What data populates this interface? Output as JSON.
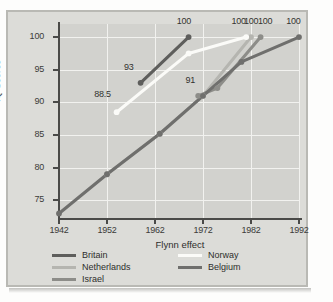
{
  "figure": {
    "caption": "",
    "colors": {
      "card_bg": "#dcdcd8",
      "plot_bg": "#d2d2ce",
      "grid": "#f2f2ef",
      "axis": "#4a4a48",
      "britain": "#5e5e5c",
      "netherlands": "#b5b5b0",
      "israel": "#8d8d89",
      "norway": "#fbfbf8",
      "belgium": "#6f6f6d"
    }
  },
  "chart_data": {
    "type": "line",
    "title": "",
    "xlabel": "Flynn effect",
    "ylabel": "IQ Scores",
    "xlim": [
      1942,
      1992
    ],
    "ylim": [
      72,
      102
    ],
    "xticks": [
      1942,
      1952,
      1962,
      1972,
      1982,
      1992
    ],
    "yticks": [
      75,
      80,
      85,
      90,
      95,
      100
    ],
    "grid": true,
    "legend_position": "below-plot",
    "series": [
      {
        "name": "Britain",
        "color": "#5e5e5c",
        "x": [
          1959,
          1969
        ],
        "y": [
          93,
          100
        ],
        "labels": [
          "93",
          "100"
        ]
      },
      {
        "name": "Netherlands",
        "color": "#b5b5b0",
        "x": [
          1952,
          1963,
          1972,
          1982
        ],
        "y": [
          79,
          85.2,
          91,
          100
        ],
        "labels": [
          "79",
          "",
          "",
          "100"
        ]
      },
      {
        "name": "Israel",
        "color": "#8d8d89",
        "x": [
          1971,
          1975,
          1984
        ],
        "y": [
          91,
          92.2,
          100
        ],
        "labels": [
          "91",
          "",
          "100"
        ]
      },
      {
        "name": "Norway",
        "color": "#fbfbf8",
        "x": [
          1954,
          1969,
          1981
        ],
        "y": [
          88.5,
          97.5,
          100
        ],
        "labels": [
          "88.5",
          "",
          "100"
        ]
      },
      {
        "name": "Belgium",
        "color": "#6f6f6d",
        "x": [
          1942,
          1952,
          1963,
          1972,
          1980,
          1992
        ],
        "y": [
          73,
          79,
          85.2,
          91,
          96.2,
          100
        ],
        "labels": [
          "",
          "",
          "",
          "",
          "",
          "100"
        ]
      }
    ],
    "point_annotations": [
      {
        "text": "100",
        "x": 1968.2,
        "y": 102.3
      },
      {
        "text": "93",
        "x": 1957.2,
        "y": 95.2
      },
      {
        "text": "88.5",
        "x": 1951.0,
        "y": 91.2
      },
      {
        "text": "91",
        "x": 1970.0,
        "y": 93.3
      },
      {
        "text": "100",
        "x": 1979.6,
        "y": 102.3
      },
      {
        "text": "100",
        "x": 1982.2,
        "y": 102.3
      },
      {
        "text": "100",
        "x": 1985.1,
        "y": 102.3
      },
      {
        "text": "100",
        "x": 1991.0,
        "y": 102.3
      }
    ]
  },
  "legend": {
    "left_column": [
      {
        "label": "Britain",
        "color": "#5e5e5c"
      },
      {
        "label": "Netherlands",
        "color": "#b5b5b0"
      },
      {
        "label": "Israel",
        "color": "#8d8d89"
      }
    ],
    "right_column": [
      {
        "label": "Norway",
        "color": "#fbfbf8"
      },
      {
        "label": "Belgium",
        "color": "#6f6f6d"
      }
    ]
  }
}
